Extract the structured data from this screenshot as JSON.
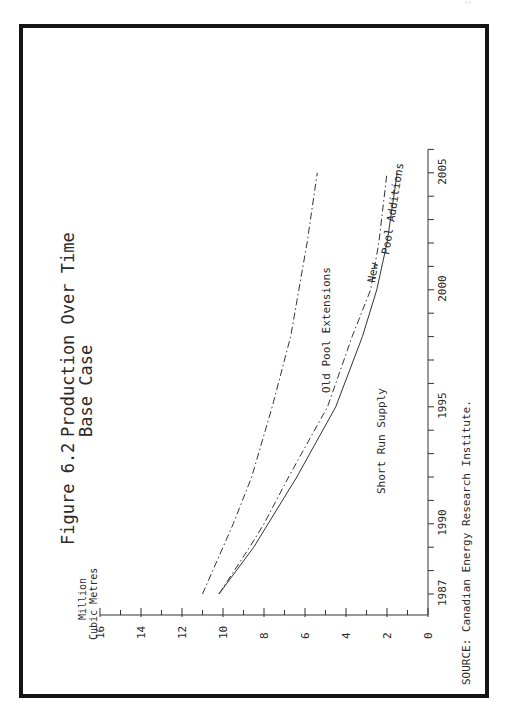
{
  "page": {
    "number_mark": "''"
  },
  "figure": {
    "label": "Figure 6.2",
    "title": "Production Over Time",
    "subtitle": "Base Case",
    "source": "SOURCE:  Canadian Energy Research Institute."
  },
  "axes": {
    "y_label_line1": "Million",
    "y_label_line2": "Cubic Metres",
    "y_ticks": [
      "0",
      "2",
      "4",
      "6",
      "8",
      "10",
      "12",
      "14",
      "16"
    ],
    "x_ticks": [
      "1987",
      "1990",
      "1995",
      "2000",
      "2005"
    ]
  },
  "series_labels": {
    "old_pool": "Old Pool Extensions",
    "new_pool_1": "New",
    "new_pool_2": "Pool Additions",
    "short_run": "Short Run Supply"
  },
  "chart_data": {
    "type": "line",
    "xlabel": "",
    "ylabel": "Million Cubic Metres",
    "orientation": "rotated 90° counter-clockwise on page",
    "ylim": [
      0,
      16
    ],
    "xlim": [
      1986,
      2006
    ],
    "x_tick_labels": [
      1987,
      1990,
      1995,
      2000,
      2005
    ],
    "y_tick_labels": [
      0,
      2,
      4,
      6,
      8,
      10,
      12,
      14,
      16
    ],
    "grid": false,
    "x": [
      1987,
      1989,
      1990,
      1992,
      1995,
      1998,
      2000,
      2002,
      2005
    ],
    "series": [
      {
        "name": "Old Pool Extensions",
        "style": "dash-dot",
        "values": [
          11.0,
          10.0,
          9.5,
          8.6,
          7.6,
          6.7,
          6.3,
          5.9,
          5.4
        ]
      },
      {
        "name": "New Pool Additions",
        "style": "dash-dot",
        "values": [
          10.2,
          8.7,
          8.0,
          6.8,
          4.9,
          3.7,
          2.8,
          2.4,
          2.0
        ]
      },
      {
        "name": "Short Run Supply",
        "style": "solid",
        "values": [
          10.2,
          8.5,
          7.8,
          6.4,
          4.5,
          3.2,
          2.5,
          2.0,
          1.5
        ]
      }
    ],
    "annotations": [
      "Old Pool Extensions",
      "New Pool Additions",
      "Short Run Supply"
    ],
    "source": "Canadian Energy Research Institute."
  },
  "colors": {
    "ink": "#2a2a2a",
    "frame": "#151515",
    "background": "#ffffff"
  }
}
